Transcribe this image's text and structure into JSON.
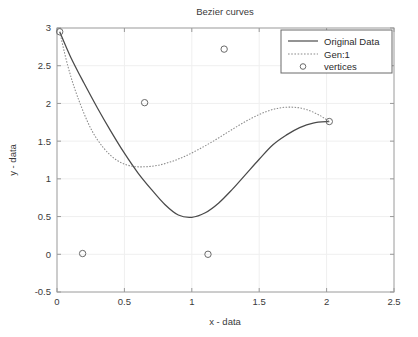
{
  "chart_data": {
    "type": "line",
    "title": "Bezier curves",
    "xlabel": "x - data",
    "ylabel": "y - data",
    "xlim": [
      0,
      2.5
    ],
    "ylim": [
      -0.5,
      3
    ],
    "xticks": [
      "0",
      "0.5",
      "1",
      "1.5",
      "2",
      "2.5"
    ],
    "xtick_values": [
      0,
      0.5,
      1,
      1.5,
      2,
      2.5
    ],
    "yticks": [
      "-0.5",
      "0",
      "0.5",
      "1",
      "1.5",
      "2",
      "2.5",
      "3"
    ],
    "ytick_values": [
      -0.5,
      0,
      0.5,
      1,
      1.5,
      2,
      2.5,
      3
    ],
    "grid": true,
    "legend_position": "upper right",
    "legend": [
      {
        "label": "Original Data",
        "style": "solid-line",
        "color": "#4a4a4a"
      },
      {
        "label": "Gen:1",
        "style": "dotted-line",
        "color": "#8a8a8a"
      },
      {
        "label": "vertices",
        "style": "circle-marker",
        "color": "#6a6a6a"
      }
    ],
    "series": [
      {
        "name": "Original Data",
        "style": "solid",
        "color": "#4a4a4a",
        "x": [
          0.02,
          0.1,
          0.2,
          0.3,
          0.4,
          0.5,
          0.6,
          0.7,
          0.8,
          0.9,
          1.0,
          1.1,
          1.2,
          1.3,
          1.4,
          1.5,
          1.6,
          1.7,
          1.8,
          1.9,
          2.02
        ],
        "y": [
          2.95,
          2.62,
          2.27,
          1.94,
          1.63,
          1.34,
          1.08,
          0.86,
          0.66,
          0.52,
          0.49,
          0.55,
          0.68,
          0.86,
          1.06,
          1.26,
          1.45,
          1.58,
          1.68,
          1.74,
          1.76
        ]
      },
      {
        "name": "Gen:1",
        "style": "dotted",
        "color": "#8a8a8a",
        "x": [
          0.02,
          0.08,
          0.15,
          0.25,
          0.35,
          0.45,
          0.55,
          0.65,
          0.75,
          0.85,
          0.95,
          1.05,
          1.15,
          1.25,
          1.35,
          1.45,
          1.55,
          1.65,
          1.75,
          1.85,
          1.95,
          2.02
        ],
        "y": [
          2.95,
          2.5,
          2.1,
          1.67,
          1.4,
          1.24,
          1.17,
          1.16,
          1.18,
          1.23,
          1.3,
          1.39,
          1.49,
          1.6,
          1.71,
          1.81,
          1.89,
          1.94,
          1.95,
          1.92,
          1.84,
          1.76
        ]
      }
    ],
    "vertices": {
      "name": "vertices",
      "marker": "circle-open",
      "color": "#6a6a6a",
      "points": [
        {
          "x": 0.02,
          "y": 2.95
        },
        {
          "x": 0.19,
          "y": 0.01
        },
        {
          "x": 0.65,
          "y": 2.01
        },
        {
          "x": 1.12,
          "y": 0.0
        },
        {
          "x": 1.24,
          "y": 2.72
        },
        {
          "x": 2.02,
          "y": 1.76
        }
      ]
    }
  },
  "colors": {
    "background": "#ffffff",
    "axis": "#9a9a9a",
    "grid": "#efefef",
    "text": "#3a3a3a",
    "solid_curve": "#4a4a4a",
    "dotted_curve": "#8a8a8a",
    "marker": "#6a6a6a"
  }
}
